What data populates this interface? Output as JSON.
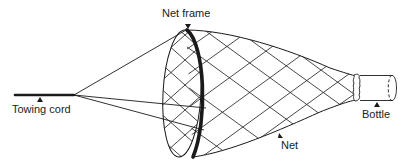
{
  "diagram": {
    "type": "labeled-illustration",
    "labels": {
      "net_frame": "Net frame",
      "towing_cord": "Towing cord",
      "net": "Net",
      "bottle": "Bottle"
    },
    "components": [
      {
        "id": "towing-cord",
        "label": "Towing cord"
      },
      {
        "id": "bridle-lines",
        "label": ""
      },
      {
        "id": "net-frame",
        "label": "Net frame"
      },
      {
        "id": "net",
        "label": "Net"
      },
      {
        "id": "bottle",
        "label": "Bottle"
      }
    ],
    "colors": {
      "line": "#1a1a1a",
      "background": "#ffffff"
    }
  }
}
